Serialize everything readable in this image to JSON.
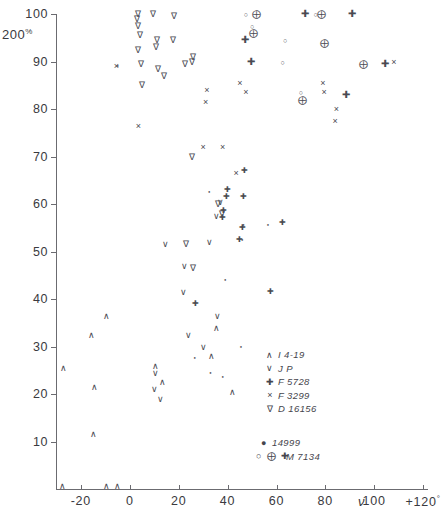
{
  "chart_data": {
    "type": "scatter",
    "title": "",
    "xlabel": "ν",
    "ylabel": "",
    "y_unit": "200%",
    "xlim": [
      -30,
      122
    ],
    "ylim": [
      0,
      100
    ],
    "x_ticks": [
      -20,
      0,
      20,
      40,
      60,
      80,
      100,
      120
    ],
    "x_tick_labels": [
      "-20",
      "0",
      "20",
      "40",
      "60",
      "80",
      "100",
      "+120"
    ],
    "x_axis_suffix": "°",
    "y_ticks": [
      10,
      20,
      30,
      40,
      50,
      60,
      70,
      80,
      90,
      100
    ],
    "y_tick_labels": [
      "10",
      "20",
      "30",
      "40",
      "50",
      "60",
      "70",
      "80",
      "90",
      "100"
    ],
    "grid": false,
    "legend_position": "lower-right",
    "series": [
      {
        "name": "I 4-19",
        "symbol": "caret",
        "glyph": "∧",
        "points": [
          [
            -27.5,
            0.6
          ],
          [
            -9.5,
            0.6
          ],
          [
            -5.0,
            0.6
          ],
          [
            -15.0,
            11.5
          ],
          [
            -14.5,
            21.5
          ],
          [
            -27.0,
            25.5
          ],
          [
            -15.5,
            32.5
          ],
          [
            -9.5,
            36.5
          ],
          [
            10.5,
            26.0
          ],
          [
            13.5,
            22.5
          ],
          [
            35.5,
            34.0
          ],
          [
            33.5,
            28.0
          ],
          [
            42.0,
            20.5
          ]
        ]
      },
      {
        "name": "J P",
        "symbol": "vee",
        "glyph": "∨",
        "points": [
          [
            10.0,
            21.0
          ],
          [
            12.5,
            19.0
          ],
          [
            10.5,
            24.5
          ],
          [
            24.0,
            32.5
          ],
          [
            30.0,
            30.0
          ],
          [
            36.0,
            36.5
          ],
          [
            22.0,
            41.5
          ],
          [
            22.5,
            47.0
          ],
          [
            14.5,
            51.5
          ],
          [
            32.5,
            52.0
          ],
          [
            35.5,
            57.5
          ],
          [
            37.0,
            60.5
          ]
        ]
      },
      {
        "name": "F 5728",
        "symbol": "plus",
        "glyph": "✚",
        "points": [
          [
            27.0,
            39.0
          ],
          [
            38.0,
            57.0
          ],
          [
            38.5,
            58.5
          ],
          [
            39.5,
            61.5
          ],
          [
            40.0,
            63.0
          ],
          [
            45.0,
            52.5
          ],
          [
            46.0,
            55.0
          ],
          [
            46.5,
            61.5
          ],
          [
            47.0,
            67.0
          ],
          [
            57.5,
            41.5
          ],
          [
            62.5,
            56.0
          ]
        ]
      },
      {
        "name": "F 3299",
        "symbol": "cross",
        "glyph": "×",
        "points": [
          [
            -5.5,
            89.0
          ],
          [
            3.5,
            76.5
          ],
          [
            30.0,
            72.0
          ],
          [
            38.0,
            72.0
          ],
          [
            31.0,
            81.5
          ],
          [
            31.5,
            84.0
          ],
          [
            43.5,
            66.5
          ],
          [
            45.0,
            85.5
          ],
          [
            47.5,
            83.5
          ],
          [
            79.0,
            85.5
          ],
          [
            79.5,
            83.5
          ],
          [
            84.0,
            77.5
          ],
          [
            84.5,
            80.0
          ],
          [
            108.0,
            90.0
          ]
        ]
      },
      {
        "name": "D 16156",
        "symbol": "nabla",
        "glyph": "∇",
        "points": [
          [
            3.5,
            100.0
          ],
          [
            3.0,
            99.0
          ],
          [
            3.5,
            97.5
          ],
          [
            9.5,
            100.0
          ],
          [
            4.0,
            95.5
          ],
          [
            11.0,
            94.5
          ],
          [
            3.5,
            92.5
          ],
          [
            10.5,
            93.0
          ],
          [
            17.5,
            94.5
          ],
          [
            18.0,
            99.5
          ],
          [
            4.5,
            89.5
          ],
          [
            11.5,
            88.5
          ],
          [
            14.0,
            87.0
          ],
          [
            25.5,
            90.0
          ],
          [
            5.0,
            85.0
          ],
          [
            22.5,
            89.5
          ],
          [
            26.0,
            91.0
          ],
          [
            25.5,
            70.0
          ],
          [
            36.0,
            60.0
          ],
          [
            37.5,
            58.0
          ],
          [
            23.0,
            51.5
          ],
          [
            26.0,
            46.5
          ]
        ]
      },
      {
        "name": "14999",
        "symbol": "dot",
        "glyph": "●",
        "points": [
          [
            -5.0,
            89.0
          ],
          [
            32.5,
            62.5
          ],
          [
            39.0,
            44.0
          ],
          [
            26.5,
            27.5
          ],
          [
            33.0,
            24.5
          ],
          [
            45.5,
            30.0
          ],
          [
            46.0,
            52.5
          ],
          [
            46.5,
            55.5
          ],
          [
            56.5,
            55.5
          ],
          [
            38.0,
            23.5
          ]
        ]
      },
      {
        "name": "M 7134",
        "symbol": "circle-group",
        "glyph": "○ ⨁ ✚",
        "points": [
          [
            47.5,
            100.0
          ],
          [
            52.0,
            100.0
          ],
          [
            71.5,
            100.0
          ],
          [
            76.0,
            100.0
          ],
          [
            78.5,
            100.0
          ],
          [
            91.0,
            100.0
          ],
          [
            50.0,
            97.5
          ],
          [
            50.5,
            96.0
          ],
          [
            47.0,
            94.5
          ],
          [
            63.5,
            94.5
          ],
          [
            79.5,
            94.0
          ],
          [
            49.5,
            90.0
          ],
          [
            62.5,
            90.0
          ],
          [
            95.5,
            89.5
          ],
          [
            104.5,
            89.5
          ],
          [
            70.0,
            83.5
          ],
          [
            70.5,
            82.0
          ],
          [
            88.5,
            83.0
          ]
        ]
      }
    ]
  },
  "legend": {
    "upper": [
      {
        "symbol": "∧",
        "label": "I 4-19"
      },
      {
        "symbol": "∨",
        "label": "J P"
      },
      {
        "symbol": "✚",
        "label": "F 5728"
      },
      {
        "symbol": "×",
        "label": "F 3299"
      },
      {
        "symbol": "∇",
        "label": "D 16156"
      }
    ],
    "lower": [
      {
        "symbol": "●",
        "label": "14999"
      },
      {
        "symbol": "○ ⨁ ✚",
        "label": "M 7134"
      }
    ]
  }
}
